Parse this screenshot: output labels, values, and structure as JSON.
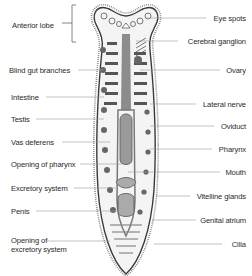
{
  "diagram": {
    "labels_left": [
      {
        "id": "anterior-lobe",
        "text": "Anterior lobe",
        "x": 12,
        "y": 21
      },
      {
        "id": "blind-gut-branches",
        "text": "Blind gut branches",
        "x": 9,
        "y": 66
      },
      {
        "id": "intestine",
        "text": "Intestine",
        "x": 11,
        "y": 93
      },
      {
        "id": "testis",
        "text": "Testis",
        "x": 11,
        "y": 115
      },
      {
        "id": "vas-deferens",
        "text": "Vas deferens",
        "x": 11,
        "y": 138
      },
      {
        "id": "opening-of-pharynx",
        "text": "Opening of pharynx",
        "x": 11,
        "y": 160
      },
      {
        "id": "excretory-system",
        "text": "Excretory system",
        "x": 11,
        "y": 184
      },
      {
        "id": "penis",
        "text": "Penis",
        "x": 11,
        "y": 207
      },
      {
        "id": "opening-of-excretory-system",
        "text": "Opening of\nexcretory system",
        "x": 11,
        "y": 236
      }
    ],
    "labels_right": [
      {
        "id": "eye-spots",
        "text": "Eye spots",
        "y": 14
      },
      {
        "id": "cerebral-ganglion",
        "text": "Cerebral ganglion",
        "y": 37
      },
      {
        "id": "ovary",
        "text": "Ovary",
        "y": 66
      },
      {
        "id": "lateral-nerve",
        "text": "Lateral nerve",
        "y": 100
      },
      {
        "id": "oviduct",
        "text": "Oviduct",
        "y": 122
      },
      {
        "id": "pharynx",
        "text": "Pharynx",
        "y": 145
      },
      {
        "id": "mouth",
        "text": "Mouth",
        "y": 168
      },
      {
        "id": "vitelline-glands",
        "text": "Vitelline glands",
        "y": 192
      },
      {
        "id": "genital-atrium",
        "text": "Genital atrium",
        "y": 216
      },
      {
        "id": "cilia",
        "text": "Cilia",
        "y": 240
      }
    ],
    "colors": {
      "body_outline": "#3a3a3a",
      "gut": "#8c8c8c",
      "organs": "#a8a8a8",
      "leader_line": "#9a9a9a",
      "text": "#2a2a2a"
    }
  }
}
